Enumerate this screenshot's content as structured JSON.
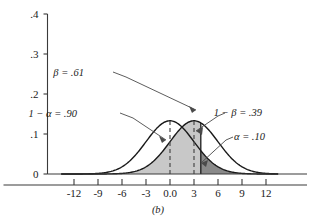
{
  "caption": "(b)",
  "chart_data": {
    "type": "line",
    "title": "",
    "subtitle": "",
    "xlabel": "",
    "ylabel": "",
    "xlim": [
      -13.5,
      13.5
    ],
    "ylim": [
      0,
      0.4
    ],
    "grid": false,
    "legend_position": "none",
    "x_ticks": [
      "-12",
      "-9",
      "-6",
      "-3",
      "0.0",
      "3",
      "6",
      "9",
      "12"
    ],
    "x_tick_values": [
      -12,
      -9,
      -6,
      -3,
      0,
      3,
      6,
      9,
      12
    ],
    "y_ticks": [
      ".4",
      ".3",
      ".2",
      ".1",
      "0"
    ],
    "y_tick_values": [
      0.4,
      0.3,
      0.2,
      0.1,
      0
    ],
    "series": [
      {
        "name": "null-distribution",
        "kind": "normal-curve",
        "mean": 0,
        "sd": 3,
        "peak": 0.133,
        "center_marker": "dashed-vertical",
        "stroke": "#1a1a1a"
      },
      {
        "name": "alternative-distribution",
        "kind": "normal-curve",
        "mean": 3,
        "sd": 3,
        "peak": 0.133,
        "center_marker": "dashed-vertical",
        "stroke": "#1a1a1a"
      }
    ],
    "critical_value": 3.85,
    "regions": [
      {
        "name": "beta-region",
        "label": "β = .61",
        "value": 0.61,
        "fill": "#c8c8c8",
        "under_curve": "alternative-distribution",
        "from": -13.5,
        "to": 3.85
      },
      {
        "name": "alpha-region",
        "label": "α = .10",
        "value": 0.1,
        "fill": "#8a8a8a",
        "under_curve": "null-distribution",
        "from": 3.85,
        "to": 13.5
      },
      {
        "name": "confidence-region",
        "label": "1 − α = .90",
        "value": 0.9,
        "fill": "none",
        "under_curve": "null-distribution",
        "from": -13.5,
        "to": 3.85
      },
      {
        "name": "power-region",
        "label": "1 − β = .39",
        "value": 0.39,
        "fill": "none",
        "under_curve": "alternative-distribution",
        "from": 3.85,
        "to": 13.5
      }
    ],
    "annotations": [
      {
        "name": "beta-annotation",
        "text": "β = .61",
        "x": 84,
        "y": 76
      },
      {
        "name": "one-minus-alpha-annotation",
        "text": "1 − α = .90",
        "x": 77,
        "y": 117
      },
      {
        "name": "one-minus-beta-annotation",
        "text": "1 − β = .39",
        "x": 262,
        "y": 116
      },
      {
        "name": "alpha-annotation",
        "text": "α = .10",
        "x": 265,
        "y": 140
      }
    ]
  },
  "colors": {
    "axis": "#3a3a3a",
    "curve": "#1a1a1a",
    "light_shade": "#c8c8c8",
    "dark_shade": "#8a8a8a",
    "text": "#1a1a1a"
  }
}
